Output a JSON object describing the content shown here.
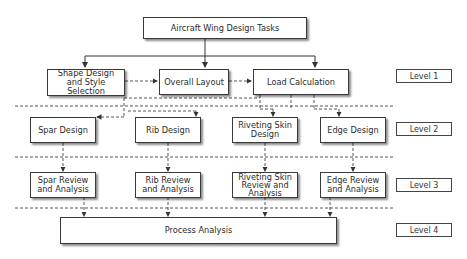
{
  "diagram": {
    "root": "Aircraft Wing Design Tasks",
    "level1": [
      "Shape Design and Style Selection",
      "Overall Layout",
      "Load Calculation"
    ],
    "level2": [
      "Spar Design",
      "Rib Design",
      "Riveting Skin Design",
      "Edge Design"
    ],
    "level3": [
      "Spar Review and Analysis",
      "Rib Review and Analysis",
      "Riveting Skin Review and Analysis",
      "Edge Review and Analysis"
    ],
    "level4": "Process Analysis",
    "level_labels": [
      "Level 1",
      "Level 2",
      "Level 3",
      "Level 4"
    ]
  }
}
